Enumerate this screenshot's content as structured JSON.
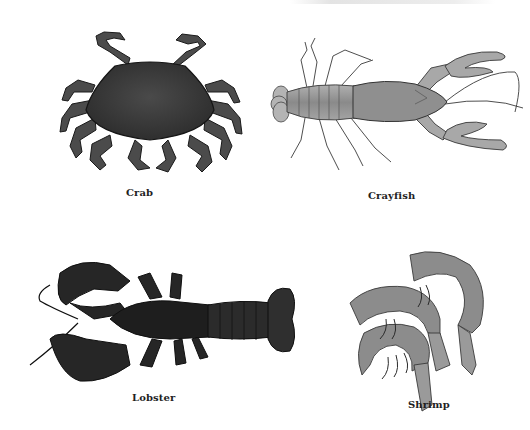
{
  "figure": {
    "background": "#ffffff",
    "label_color": "#1f1f1f",
    "panels": [
      {
        "id": "crab",
        "label": "Crab",
        "tone": "#3d3d3d"
      },
      {
        "id": "crayfish",
        "label": "Crayfish",
        "tone": "#9a9a9a"
      },
      {
        "id": "lobster",
        "label": "Lobster",
        "tone": "#262626"
      },
      {
        "id": "shrimp",
        "label": "Shrimp",
        "tone": "#8a8a8a"
      }
    ]
  }
}
